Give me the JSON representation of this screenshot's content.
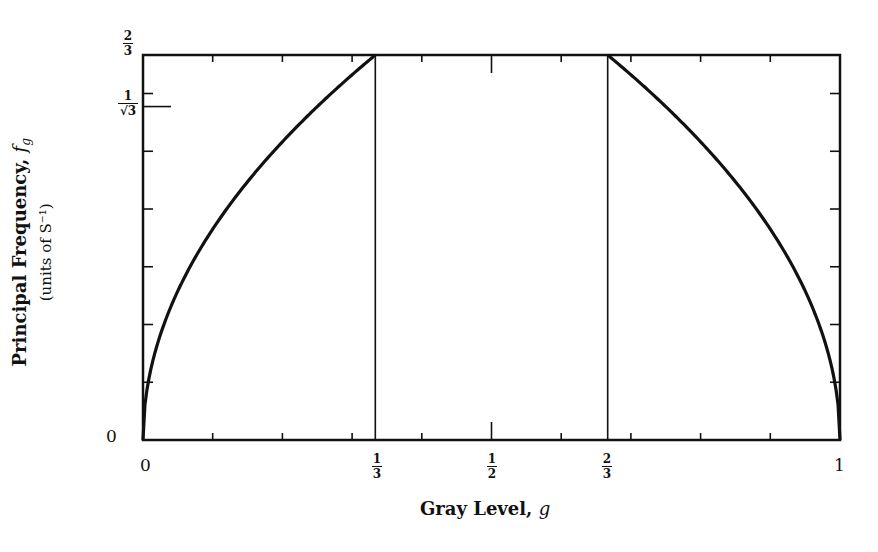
{
  "chart_data": {
    "type": "line",
    "title": "",
    "xlabel": "Gray Level, g",
    "ylabel": "Principal Frequency, f_g",
    "ylabel_sub": "(units of S^-1)",
    "xlim": [
      0,
      1
    ],
    "ylim": [
      0,
      0.6667
    ],
    "grid": false,
    "x_tick_labels": [
      "0",
      "1/3",
      "1/2",
      "2/3",
      "1"
    ],
    "x_tick_values": [
      0,
      0.3333,
      0.5,
      0.6667,
      1
    ],
    "x_minor_ticks": [
      0.1,
      0.2,
      0.3,
      0.4,
      0.6,
      0.7,
      0.8,
      0.9
    ],
    "y_tick_labels": [
      "0",
      "1/√3",
      "2/3"
    ],
    "y_tick_values": [
      0,
      0.5774,
      0.6667
    ],
    "y_minor_ticks": [
      0.1,
      0.2,
      0.3,
      0.4,
      0.5,
      0.6
    ],
    "vertical_lines": [
      0.3333,
      0.6667
    ],
    "series": [
      {
        "name": "left branch",
        "x": [
          0,
          0.01,
          0.02,
          0.05,
          0.1,
          0.15,
          0.2,
          0.25,
          0.3,
          0.3333
        ],
        "y": [
          0,
          0.115,
          0.163,
          0.258,
          0.365,
          0.447,
          0.516,
          0.577,
          0.632,
          0.6667
        ]
      },
      {
        "name": "middle plateau",
        "x": [
          0.3333,
          0.6667
        ],
        "y": [
          0.6667,
          0.6667
        ]
      },
      {
        "name": "right branch",
        "x": [
          0.6667,
          0.7,
          0.75,
          0.8,
          0.85,
          0.9,
          0.95,
          0.98,
          0.99,
          1
        ],
        "y": [
          0.6667,
          0.632,
          0.577,
          0.516,
          0.447,
          0.365,
          0.258,
          0.163,
          0.115,
          0
        ]
      }
    ]
  },
  "labels": {
    "xlabel_text": "Gray Level,",
    "xlabel_var": "g",
    "ylabel_text": "Principal Frequency,",
    "ylabel_var": "f",
    "ylabel_var_sub": "g",
    "ylabel_sub": "(units of S⁻¹)",
    "y_zero": "0",
    "x_zero": "0",
    "x_one": "1",
    "frac_one_third_num": "1",
    "frac_one_third_den": "3",
    "frac_half_num": "1",
    "frac_half_den": "2",
    "frac_two_thirds_num": "2",
    "frac_two_thirds_den": "3",
    "frac_inv_sqrt3_num": "1",
    "frac_inv_sqrt3_den": "√3"
  }
}
